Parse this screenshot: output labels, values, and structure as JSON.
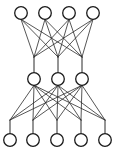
{
  "figure": {
    "title": "",
    "type": "neural-network-graph",
    "background_color": "#ffffff",
    "width": 120,
    "height": 155
  },
  "chart_data": {
    "type": "diagram",
    "title": "",
    "xlabel": "",
    "ylabel": "",
    "layers": [
      {
        "name": "top-layer",
        "count": 4,
        "y": 13,
        "x": [
          21,
          45,
          69,
          93
        ],
        "labels": [
          "",
          "",
          "",
          ""
        ]
      },
      {
        "name": "middle-layer",
        "count": 3,
        "y": 79,
        "x": [
          34,
          58,
          82
        ],
        "labels": [
          "",
          "",
          ""
        ]
      },
      {
        "name": "bottom-layer",
        "count": 5,
        "y": 140,
        "x": [
          10,
          33,
          57,
          81,
          105
        ],
        "labels": [
          "",
          "",
          "",
          "",
          ""
        ]
      }
    ],
    "funnels": [
      {
        "name": "funnel-to-middle",
        "y": 57,
        "x": [
          34,
          58,
          82
        ],
        "stub_end_y": 72
      },
      {
        "name": "funnel-to-bottom",
        "y": 120,
        "x": [
          10,
          33,
          57,
          81,
          105
        ],
        "stub_end_y": 133
      }
    ],
    "connections": [
      {
        "from_layer": "top-layer",
        "to_layer": "middle-layer",
        "pattern": "fully-connected",
        "edge_count": 12
      },
      {
        "from_layer": "middle-layer",
        "to_layer": "bottom-layer",
        "pattern": "fully-connected",
        "edge_count": 15
      }
    ],
    "legend": [],
    "annotations": []
  },
  "style": {
    "node_stroke_color": "#1a1a1a",
    "node_fill_color": "#ffffff",
    "node_radius": 6.3,
    "node_stroke_width": 1.3,
    "edge_color": "#2b2b2b",
    "edge_width": 0.8,
    "stub_color": "#2b2b2b",
    "stub_width": 1.0
  }
}
